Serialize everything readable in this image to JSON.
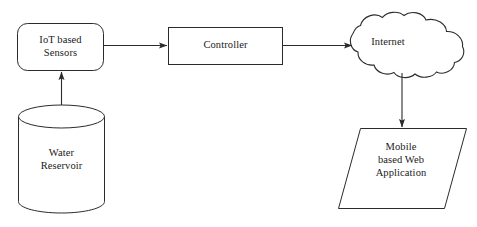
{
  "diagram": {
    "background_color": "#ffffff",
    "stroke_color": "#2b2b2b",
    "nodes": [
      {
        "id": "iot-sensors",
        "label": "IoT based\nSensors",
        "shape": "rounded-rectangle"
      },
      {
        "id": "controller",
        "label": "Controller",
        "shape": "rectangle"
      },
      {
        "id": "internet",
        "label": "Internet",
        "shape": "cloud"
      },
      {
        "id": "water-reservoir",
        "label": "Water\nReservoir",
        "shape": "cylinder"
      },
      {
        "id": "mobile-app",
        "label": "Mobile\nbased Web\nApplication",
        "shape": "parallelogram"
      }
    ],
    "edges": [
      {
        "id": "edge-reservoir-to-sensors",
        "from": "water-reservoir",
        "to": "iot-sensors",
        "label": "",
        "direction": "up"
      },
      {
        "id": "edge-sensors-to-controller",
        "from": "iot-sensors",
        "to": "controller",
        "label": "",
        "direction": "right"
      },
      {
        "id": "edge-controller-to-internet",
        "from": "controller",
        "to": "internet",
        "label": "",
        "direction": "right"
      },
      {
        "id": "edge-internet-to-mobile",
        "from": "internet",
        "to": "mobile-app",
        "label": "",
        "direction": "down"
      }
    ]
  }
}
